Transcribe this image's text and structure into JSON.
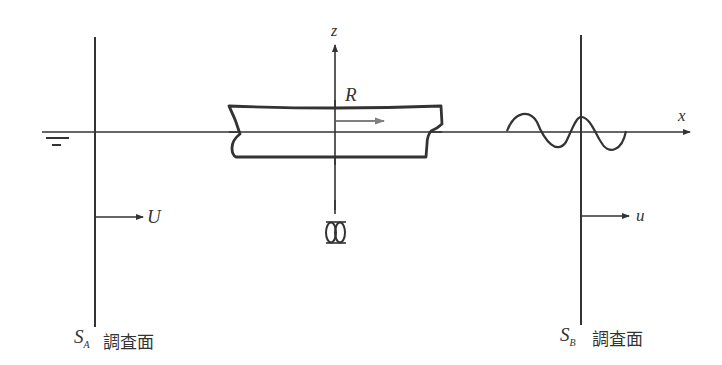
{
  "diagram": {
    "axes": {
      "x_label": "x",
      "z_label": "z"
    },
    "body_label": "R",
    "left_section": {
      "symbol": "S",
      "subscript": "A",
      "caption": "調査面",
      "velocity_label": "U"
    },
    "right_section": {
      "symbol": "S",
      "subscript": "B",
      "caption": "調査面",
      "velocity_label": "u"
    },
    "icons": {
      "water_surface": "water-surface-symbol",
      "propeller": "propeller-symbol"
    },
    "colors": {
      "line": "#333333",
      "force_arrow": "#808080"
    }
  }
}
